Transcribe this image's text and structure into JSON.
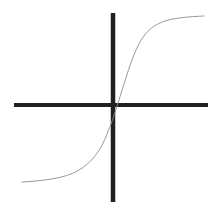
{
  "figure": {
    "width": 223,
    "height": 208,
    "background_color": "#ffffff",
    "title": "",
    "caption": ""
  },
  "axes": {
    "x_axis": {
      "label": "",
      "color": "#231f20",
      "thickness": 4,
      "start_x": 14,
      "end_x": 208,
      "y": 105
    },
    "y_axis": {
      "label": "",
      "color": "#231f20",
      "thickness": 4.5,
      "x": 113,
      "start_y": 13,
      "end_y": 202
    },
    "origin": {
      "x": 113,
      "y": 105
    }
  },
  "chart_data": {
    "type": "line",
    "title": "",
    "subtitle": "",
    "xlabel": "",
    "ylabel": "",
    "grid": false,
    "legend_position": "none",
    "annotations": [],
    "xlim": [
      -3.8,
      4.0
    ],
    "ylim": [
      -1.05,
      1.05
    ],
    "x_tick_labels": [],
    "y_tick_labels": [],
    "series": [
      {
        "name": "sigmoid",
        "color": "#8c8c8c",
        "line_width": 0.9,
        "style": "solid",
        "x": [
          -3.8,
          -3.5,
          -3.2,
          -2.9,
          -2.6,
          -2.3,
          -2.0,
          -1.8,
          -1.6,
          -1.4,
          -1.2,
          -1.0,
          -0.85,
          -0.7,
          -0.55,
          -0.4,
          -0.25,
          -0.1,
          0.0,
          0.1,
          0.25,
          0.4,
          0.55,
          0.7,
          0.85,
          1.0,
          1.2,
          1.4,
          1.6,
          1.8,
          2.0,
          2.3,
          2.6,
          2.9,
          3.2,
          3.5,
          3.8,
          4.0
        ],
        "y": [
          -0.967,
          -0.962,
          -0.955,
          -0.946,
          -0.935,
          -0.92,
          -0.9,
          -0.883,
          -0.862,
          -0.835,
          -0.8,
          -0.757,
          -0.718,
          -0.672,
          -0.617,
          -0.55,
          -0.468,
          -0.367,
          -0.3,
          -0.225,
          -0.1,
          0.03,
          0.16,
          0.29,
          0.41,
          0.52,
          0.64,
          0.73,
          0.795,
          0.842,
          0.876,
          0.912,
          0.934,
          0.948,
          0.958,
          0.965,
          0.97,
          0.973
        ]
      }
    ],
    "curve_endpoints": {
      "left_px": {
        "x": 22,
        "y": 182
      },
      "right_px": {
        "x": 204,
        "y": 16
      }
    },
    "svg_path": "M 22,182 C 45,186 66,178 84,158 C 97,143 104,124 109,112 C 111,107 112,105 113,104 C 115,101 118,93 124,80 C 134,57 148,34 166,24 C 180,17 194,16 204,16"
  },
  "icons": {
    "x_axis_line": "horizontal-axis-line",
    "y_axis_line": "vertical-axis-line",
    "curve": "sigmoid-curve-line"
  }
}
